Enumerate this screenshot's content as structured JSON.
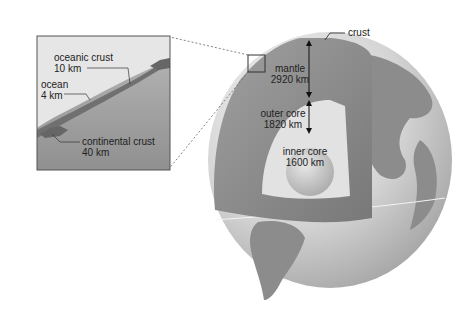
{
  "diagram": {
    "inset": {
      "labels": [
        {
          "name": "oceanic crust",
          "value": "10 km"
        },
        {
          "name": "ocean",
          "value": "4 km"
        },
        {
          "name": "continental crust",
          "value": "40 km"
        }
      ]
    },
    "globe": {
      "labels": [
        {
          "name": "crust",
          "value": ""
        },
        {
          "name": "mantle",
          "value": "2920 km"
        },
        {
          "name": "outer core",
          "value": "1820 km"
        },
        {
          "name": "inner core",
          "value": "1600 km"
        }
      ]
    },
    "colors": {
      "mantle": "#8a8a8a",
      "outer_core": "#d8d8d8",
      "inner_core": "#c4c4c4",
      "land": "#8c8c8c",
      "ocean": "#d0d0d0"
    }
  }
}
